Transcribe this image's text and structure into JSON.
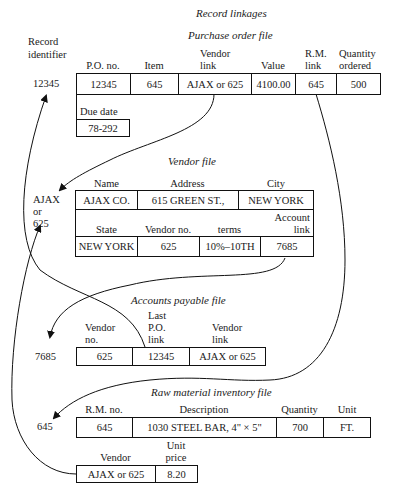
{
  "title": "Record linkages",
  "record_identifier_label": "Record identifier",
  "purchase_order": {
    "title": "Purchase order file",
    "identifier": "12345",
    "headers": [
      "P.O. no.",
      "Item",
      "Vendor link",
      "Value",
      "R.M. link",
      "Quantity ordered"
    ],
    "values": [
      "12345",
      "645",
      "AJAX or 625",
      "4100.00",
      "645",
      "500"
    ],
    "due_date_label": "Due date",
    "due_date": "78-292"
  },
  "vendor": {
    "title": "Vendor file",
    "identifier": [
      "AJAX",
      "or",
      "625"
    ],
    "row1_headers": [
      "Name",
      "Address",
      "City"
    ],
    "row1_values": [
      "AJAX CO.",
      "615 GREEN ST.,",
      "NEW YORK"
    ],
    "row2_headers": [
      "State",
      "Vendor no.",
      "terms",
      "Account link"
    ],
    "row2_values": [
      "NEW YORK",
      "625",
      "10%–10TH",
      "7685"
    ]
  },
  "accounts_payable": {
    "title": "Accounts payable file",
    "identifier": "7685",
    "headers": [
      "Vendor no.",
      "Last P.O. link",
      "Vendor link"
    ],
    "values": [
      "625",
      "12345",
      "AJAX or 625"
    ]
  },
  "raw_material": {
    "title": "Raw material inventory file",
    "identifier": "645",
    "headers": [
      "R.M. no.",
      "Description",
      "Quantity",
      "Unit"
    ],
    "values": [
      "645",
      "1030 STEEL BAR, 4\" × 5\"",
      "700",
      "FT."
    ],
    "row2_headers": [
      "Vendor",
      "Unit price"
    ],
    "row2_values": [
      "AJAX or 625",
      "8.20"
    ]
  }
}
